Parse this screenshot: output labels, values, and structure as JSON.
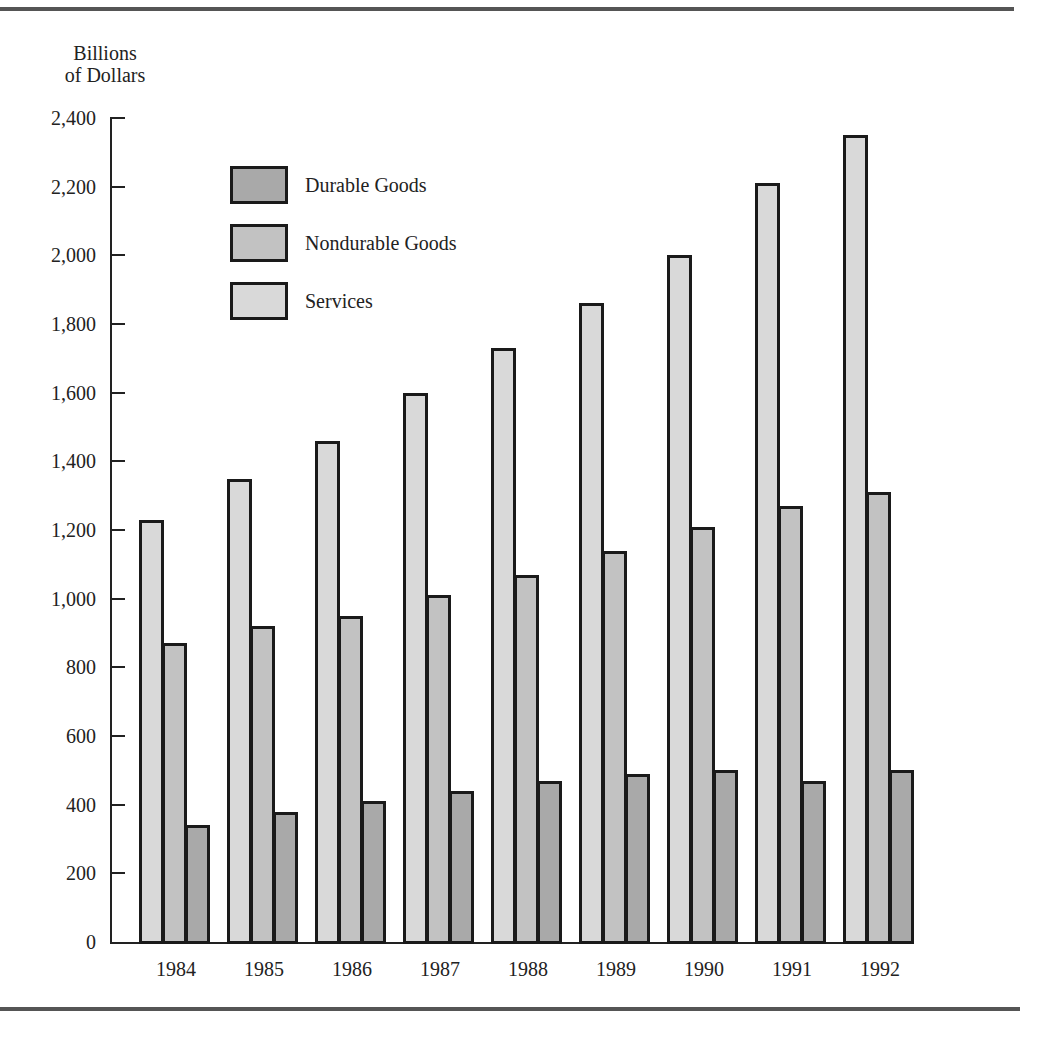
{
  "chart_data": {
    "type": "bar",
    "title": "",
    "ylabel": "Billions of Dollars",
    "ylabel_lines": [
      "Billions",
      "of Dollars"
    ],
    "xlabel": "",
    "ylim": [
      0,
      2400
    ],
    "yticks": [
      0,
      200,
      400,
      600,
      800,
      1000,
      1200,
      1400,
      1600,
      1800,
      2000,
      2200,
      2400
    ],
    "ytick_labels": [
      "0",
      "200",
      "400",
      "600",
      "800",
      "1,000",
      "1,200",
      "1,400",
      "1,600",
      "1,800",
      "2,000",
      "2,200",
      "2,400"
    ],
    "categories": [
      "1984",
      "1985",
      "1986",
      "1987",
      "1988",
      "1989",
      "1990",
      "1991",
      "1992"
    ],
    "series": [
      {
        "name": "Services",
        "color": "#d9d9d9",
        "values": [
          1230,
          1350,
          1460,
          1600,
          1730,
          1860,
          2000,
          2210,
          2350
        ]
      },
      {
        "name": "Nondurable Goods",
        "color": "#c2c2c2",
        "values": [
          870,
          920,
          950,
          1010,
          1070,
          1140,
          1210,
          1270,
          1310
        ]
      },
      {
        "name": "Durable Goods",
        "color": "#a9a9a9",
        "values": [
          340,
          380,
          410,
          440,
          470,
          490,
          500,
          470,
          500
        ]
      }
    ],
    "legend": {
      "position": "upper-left",
      "entries": [
        {
          "name": "Durable Goods",
          "color": "#a9a9a9"
        },
        {
          "name": "Nondurable Goods",
          "color": "#c2c2c2"
        },
        {
          "name": "Services",
          "color": "#d9d9d9"
        }
      ]
    },
    "grid": false
  }
}
